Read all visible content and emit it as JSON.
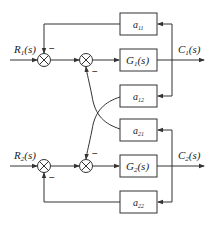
{
  "diagram": {
    "title": "",
    "inputs": [
      {
        "label": "R",
        "sub": "1",
        "suffix": "(s)"
      },
      {
        "label": "R",
        "sub": "2",
        "suffix": "(s)"
      }
    ],
    "outputs": [
      {
        "label": "C",
        "sub": "1",
        "suffix": "(s)"
      },
      {
        "label": "C",
        "sub": "2",
        "suffix": "(s)"
      }
    ],
    "blocks": [
      {
        "id": "a11",
        "label": "a",
        "sub": "11"
      },
      {
        "id": "G1",
        "label": "G",
        "sub": "1",
        "suffix": "(s)"
      },
      {
        "id": "a12",
        "label": "a",
        "sub": "12"
      },
      {
        "id": "a21",
        "label": "a",
        "sub": "21"
      },
      {
        "id": "G2",
        "label": "G",
        "sub": "2",
        "suffix": "(s)"
      },
      {
        "id": "a22",
        "label": "a",
        "sub": "22"
      }
    ],
    "signs": {
      "minus": "−"
    },
    "colors": {
      "line": "#333333",
      "background": "#ffffff"
    }
  }
}
